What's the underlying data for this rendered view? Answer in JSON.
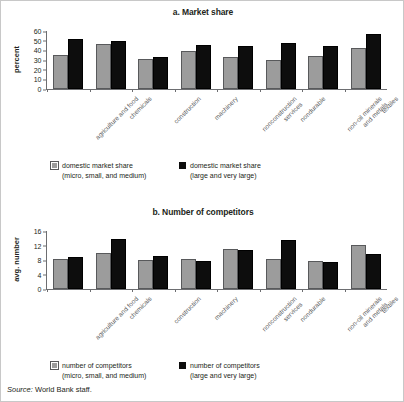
{
  "figure": {
    "source_label": "Source:",
    "source_text": "World Bank staff."
  },
  "panel_a": {
    "title": "a. Market share",
    "ylabel": "percent",
    "legend": [
      {
        "line1": "domestic market share",
        "line2": "(micro, small, and medium)",
        "swatch": "gray-swatch"
      },
      {
        "line1": "domestic market share",
        "line2": "(large and very large)",
        "swatch": "black-swatch"
      }
    ]
  },
  "panel_b": {
    "title": "b. Number of competitors",
    "ylabel": "avg. number",
    "legend": [
      {
        "line1": "number of competitors",
        "line2": "(micro, small, and medium)",
        "swatch": "gray-swatch"
      },
      {
        "line1": "number of competitors",
        "line2": "(large and very large)",
        "swatch": "black-swatch"
      }
    ]
  },
  "chart_data": [
    {
      "id": "market-share",
      "type": "bar",
      "title": "a. Market share",
      "xlabel": "",
      "ylabel": "percent",
      "ylim": [
        0,
        60
      ],
      "yticks": [
        0,
        10,
        20,
        30,
        40,
        50,
        60
      ],
      "grid": false,
      "legend_position": "bottom",
      "categories": [
        "agriculture and food",
        "chemicals",
        "construction",
        "machinery",
        "nonconstruction services",
        "nondurable",
        "non-oil minerals and metals",
        "textiles"
      ],
      "categories_wrapped": [
        [
          "agriculture and food"
        ],
        [
          "chemicals"
        ],
        [
          "construction"
        ],
        [
          "machinery"
        ],
        [
          "nonconstruction",
          "services"
        ],
        [
          "nondurable"
        ],
        [
          "non-oil minerals",
          "and metals"
        ],
        [
          "textiles"
        ]
      ],
      "series": [
        {
          "name": "domestic market share (micro, small, and medium)",
          "color": "#9c9c9c",
          "values": [
            35,
            46.5,
            31.5,
            39.5,
            33,
            29.5,
            34,
            42
          ]
        },
        {
          "name": "domestic market share (large and very large)",
          "color": "#0d0d0d",
          "values": [
            52,
            49.5,
            33,
            46,
            45,
            47.5,
            44.5,
            57
          ]
        }
      ]
    },
    {
      "id": "number-of-competitors",
      "type": "bar",
      "title": "b. Number of competitors",
      "xlabel": "",
      "ylabel": "avg. number",
      "ylim": [
        0,
        16
      ],
      "yticks": [
        0,
        4,
        8,
        12,
        16
      ],
      "grid": false,
      "legend_position": "bottom",
      "categories": [
        "agriculture and food",
        "chemicals",
        "construction",
        "machinery",
        "nonconstruction services",
        "nondurable",
        "non-oil minerals and metals",
        "textiles"
      ],
      "categories_wrapped": [
        [
          "agriculture and food"
        ],
        [
          "chemicals"
        ],
        [
          "construction"
        ],
        [
          "machinery"
        ],
        [
          "nonconstruction",
          "services"
        ],
        [
          "nondurable"
        ],
        [
          "non-oil minerals",
          "and metals"
        ],
        [
          "textiles"
        ]
      ],
      "series": [
        {
          "name": "number of competitors (micro, small, and medium)",
          "color": "#9c9c9c",
          "values": [
            8.2,
            9.8,
            8.0,
            8.2,
            11.1,
            8.2,
            7.6,
            12.2
          ]
        },
        {
          "name": "number of competitors (large and very large)",
          "color": "#0d0d0d",
          "values": [
            8.7,
            13.9,
            9.0,
            7.6,
            10.8,
            13.4,
            7.4,
            9.7
          ]
        }
      ]
    }
  ]
}
